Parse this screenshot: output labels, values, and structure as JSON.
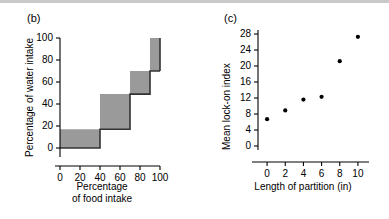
{
  "figure": {
    "background": "#ffffff",
    "rule_color": "#c9c9c9"
  },
  "panels": [
    {
      "id": "b",
      "label": "(b)"
    },
    {
      "id": "c",
      "label": "(c)"
    }
  ],
  "chart_data": [
    {
      "type": "area",
      "panel": "b",
      "title": "(b)",
      "xlabel": "Percentage",
      "xlabel_line2": "of food intake",
      "ylabel": "Percentage of water intake",
      "xlim": [
        0,
        100
      ],
      "ylim": [
        0,
        100
      ],
      "xticks": [
        0,
        20,
        40,
        60,
        80,
        100
      ],
      "yticks": [
        0,
        20,
        40,
        60,
        80,
        100
      ],
      "xticklabels": [
        "0",
        "20",
        "40",
        "60",
        "80",
        "100"
      ],
      "yticklabels": [
        "0",
        "20",
        "40",
        "60",
        "80",
        "100"
      ],
      "grid": false,
      "legend": "none",
      "fill_color": "#9a9a9a",
      "edge_color": "#333333",
      "steps": [
        {
          "x_start": 0,
          "x_end": 40,
          "y_low": 0,
          "y_high": 17
        },
        {
          "x_start": 40,
          "x_end": 70,
          "y_low": 17,
          "y_high": 49
        },
        {
          "x_start": 70,
          "x_end": 90,
          "y_low": 49,
          "y_high": 70
        },
        {
          "x_start": 90,
          "x_end": 100,
          "y_low": 70,
          "y_high": 100
        }
      ],
      "lower_boundary": [
        {
          "x": 0,
          "y": 0
        },
        {
          "x": 40,
          "y": 0
        },
        {
          "x": 40,
          "y": 17
        },
        {
          "x": 70,
          "y": 17
        },
        {
          "x": 70,
          "y": 49
        },
        {
          "x": 90,
          "y": 49
        },
        {
          "x": 90,
          "y": 70
        },
        {
          "x": 100,
          "y": 70
        }
      ],
      "upper_boundary": [
        {
          "x": 0,
          "y": 17
        },
        {
          "x": 40,
          "y": 17
        },
        {
          "x": 40,
          "y": 49
        },
        {
          "x": 70,
          "y": 49
        },
        {
          "x": 70,
          "y": 70
        },
        {
          "x": 90,
          "y": 70
        },
        {
          "x": 90,
          "y": 100
        },
        {
          "x": 100,
          "y": 100
        }
      ]
    },
    {
      "type": "scatter",
      "panel": "c",
      "title": "(c)",
      "xlabel": "Length of partition (in)",
      "ylabel": "Mean lock-on index",
      "xlim": [
        -1,
        11
      ],
      "ylim": [
        0,
        29
      ],
      "xticks": [
        0,
        2,
        4,
        6,
        8,
        10
      ],
      "yticks": [
        0,
        4,
        8,
        12,
        16,
        20,
        24,
        28
      ],
      "xticklabels": [
        "0",
        "2",
        "4",
        "6",
        "8",
        "10"
      ],
      "yticklabels": [
        "0",
        "4",
        "8",
        "12",
        "16",
        "20",
        "24",
        "28"
      ],
      "grid": false,
      "legend": "none",
      "marker_color": "#000000",
      "x": [
        0,
        2,
        4,
        6,
        8,
        10
      ],
      "values": [
        6.7,
        8.9,
        11.6,
        12.3,
        21.2,
        27.3
      ]
    }
  ]
}
